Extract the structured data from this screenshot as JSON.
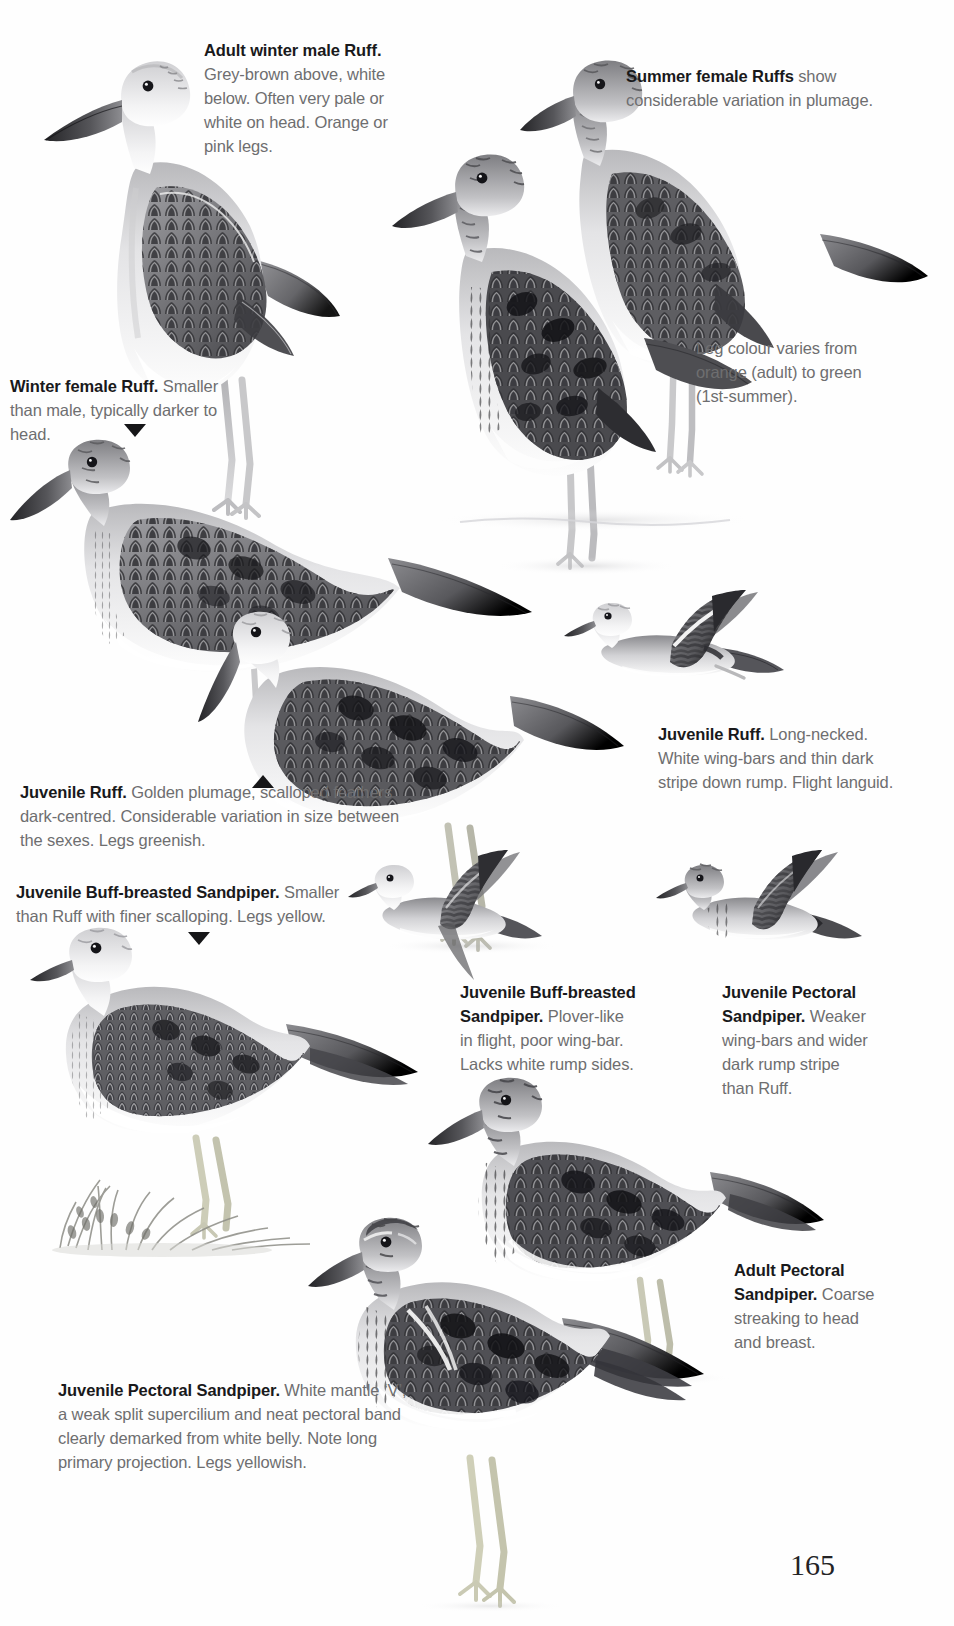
{
  "page": {
    "folio": "165",
    "plate_subject": "Ruff, Buff-breasted Sandpiper and Pectoral Sandpiper"
  },
  "captions": {
    "adult_winter_male_ruff": {
      "heading": "Adult winter male Ruff.",
      "body": "Grey-brown above, white below. Often very pale or white on head. Orange or pink legs."
    },
    "summer_female_ruffs": {
      "heading": "Summer female Ruffs",
      "body": "show considerable variation in plumage."
    },
    "leg_colour_note": {
      "body": "Leg colour varies from orange (adult) to green (1st-summer)."
    },
    "winter_female_ruff": {
      "heading": "Winter female Ruff.",
      "body": "Smaller than male, typically darker to head."
    },
    "juvenile_ruff_flight": {
      "heading": "Juvenile Ruff.",
      "body": "Long-necked. White wing-bars and thin dark stripe down rump. Flight languid."
    },
    "juvenile_ruff_standing": {
      "heading": "Juvenile Ruff.",
      "body": "Golden plumage, scalloped feathers dark-centred. Considerable variation in size between the sexes. Legs greenish."
    },
    "juvenile_buff_breasted_standing": {
      "heading": "Juvenile Buff-breasted Sandpiper.",
      "body": "Smaller than Ruff with finer scalloping. Legs yellow."
    },
    "juvenile_buff_breasted_flight": {
      "heading": "Juvenile Buff-breasted Sandpiper.",
      "body": "Plover-like in flight, poor wing-bar. Lacks white rump sides."
    },
    "juvenile_pectoral_flight": {
      "heading": "Juvenile Pectoral Sandpiper.",
      "body": "Weaker wing-bars and wider dark rump stripe than Ruff."
    },
    "adult_pectoral_standing": {
      "heading": "Adult Pectoral Sandpiper.",
      "body": "Coarse streaking to head and breast."
    },
    "juvenile_pectoral_standing": {
      "heading": "Juvenile Pectoral Sandpiper.",
      "body": "White mantle ‘V’, a weak split supercilium and neat pectoral band clearly demarked from white belly. Note long primary projection. Legs yellowish."
    }
  },
  "markers": {
    "winter_female_pointer": "triangle-down",
    "juvenile_ruff_pointer": "triangle-up",
    "juvenile_buff_breasted_pointer": "triangle-down"
  },
  "illustrations": [
    {
      "name": "adult-winter-male-ruff",
      "pose": "standing",
      "species": "Ruff"
    },
    {
      "name": "summer-female-ruff-rear",
      "pose": "standing",
      "species": "Ruff"
    },
    {
      "name": "summer-female-ruff-front",
      "pose": "standing",
      "species": "Ruff"
    },
    {
      "name": "winter-female-ruff",
      "pose": "standing",
      "species": "Ruff"
    },
    {
      "name": "juvenile-ruff-standing",
      "pose": "standing",
      "species": "Ruff"
    },
    {
      "name": "juvenile-ruff-flight",
      "pose": "flight",
      "species": "Ruff"
    },
    {
      "name": "juvenile-buff-breasted-flight",
      "pose": "flight",
      "species": "Buff-breasted Sandpiper"
    },
    {
      "name": "juvenile-pectoral-flight",
      "pose": "flight",
      "species": "Pectoral Sandpiper"
    },
    {
      "name": "juvenile-buff-breasted-standing",
      "pose": "standing",
      "species": "Buff-breasted Sandpiper"
    },
    {
      "name": "adult-pectoral-standing",
      "pose": "standing",
      "species": "Pectoral Sandpiper"
    },
    {
      "name": "juvenile-pectoral-standing",
      "pose": "standing",
      "species": "Pectoral Sandpiper"
    },
    {
      "name": "grass-tussock",
      "pose": "vegetation",
      "species": ""
    }
  ],
  "colors": {
    "body_text": "#6e6e70",
    "heading_text": "#19191b",
    "page_background": "#fefefe",
    "plumage_dark": "#3a3a3d",
    "plumage_mid": "#8d8d90",
    "plumage_light": "#d8d8da"
  }
}
